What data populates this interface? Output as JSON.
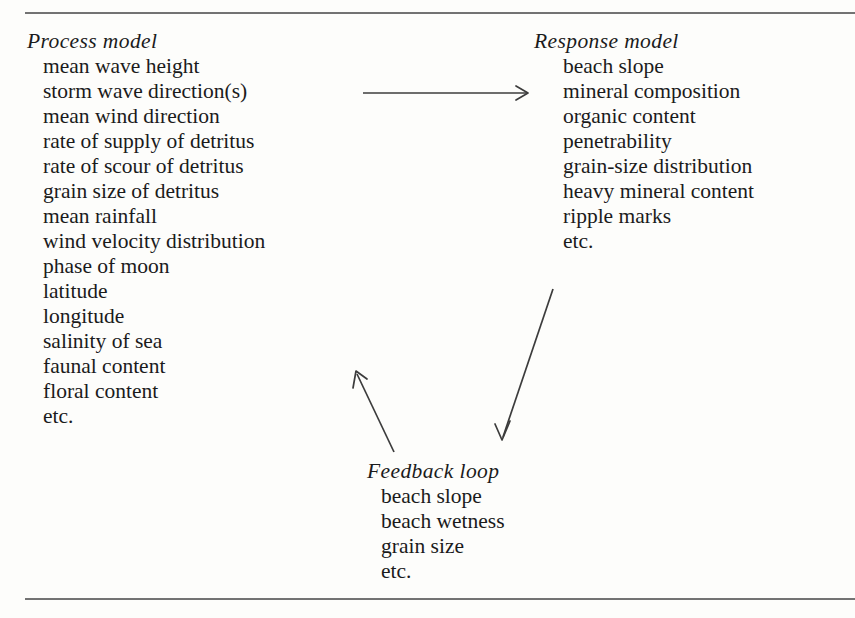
{
  "figure": {
    "paper_color": "#fdfdfb",
    "ink_color": "#1b1b1b",
    "rule_color": "#4a4a4a"
  },
  "rules": {
    "top_label": "top-horizontal-rule",
    "bottom_label": "bottom-horizontal-rule"
  },
  "blocks": {
    "process": {
      "heading": "Process model",
      "items": [
        "mean wave height",
        "storm wave direction(s)",
        "mean wind direction",
        "rate of supply of detritus",
        "rate of scour of detritus",
        "grain size of detritus",
        "mean rainfall",
        "wind velocity distribution",
        "phase of moon",
        "latitude",
        "longitude",
        "salinity of sea",
        "faunal content",
        "floral content",
        "etc."
      ]
    },
    "response": {
      "heading": "Response model",
      "items": [
        "beach slope",
        "mineral composition",
        "organic content",
        "penetrability",
        "grain-size distribution",
        "heavy mineral content",
        "ripple marks",
        "etc."
      ]
    },
    "feedback": {
      "heading": "Feedback loop",
      "items": [
        "beach slope",
        "beach wetness",
        "grain size",
        "etc."
      ]
    }
  },
  "arrows": [
    {
      "name": "process-to-response-arrow",
      "direction": "right",
      "from": [
        363,
        93
      ],
      "to": [
        528,
        93
      ]
    },
    {
      "name": "response-to-feedback-arrow",
      "direction": "down-left",
      "from": [
        553,
        289
      ],
      "to": [
        502,
        439
      ]
    },
    {
      "name": "feedback-to-process-arrow",
      "direction": "up-left",
      "from": [
        394,
        452
      ],
      "to": [
        356,
        372
      ]
    }
  ]
}
